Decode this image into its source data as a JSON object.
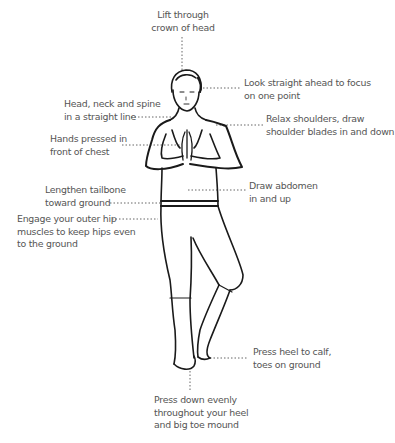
{
  "diagram": {
    "colors": {
      "text": "#555555",
      "line": "#1a1a1a",
      "leader": "#666666"
    },
    "annotations": [
      {
        "id": "crown",
        "lines": [
          "Lift through",
          "crown of head"
        ]
      },
      {
        "id": "gaze",
        "lines": [
          "Look straight ahead to focus",
          "on one point"
        ]
      },
      {
        "id": "spine",
        "lines": [
          "Head, neck and spine",
          "in a straight line"
        ]
      },
      {
        "id": "shoulders",
        "lines": [
          "Relax shoulders, draw",
          "shoulder blades in and down"
        ]
      },
      {
        "id": "hands",
        "lines": [
          "Hands pressed in",
          "front of chest"
        ]
      },
      {
        "id": "abdomen",
        "lines": [
          "Draw abdomen",
          "in and up"
        ]
      },
      {
        "id": "tailbone",
        "lines": [
          "Lengthen tailbone",
          "toward ground"
        ]
      },
      {
        "id": "hips",
        "lines": [
          "Engage your outer hip",
          "muscles to keep hips even",
          "to the ground"
        ]
      },
      {
        "id": "heel",
        "lines": [
          "Press heel to calf,",
          "toes on ground"
        ]
      },
      {
        "id": "foot",
        "lines": [
          "Press down evenly",
          "throughout your heel",
          "and big toe mound"
        ]
      }
    ]
  }
}
